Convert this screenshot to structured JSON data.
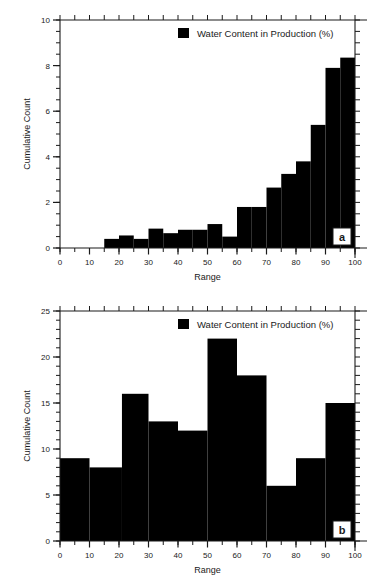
{
  "figure": {
    "background": "#ffffff",
    "series_color": "#000000",
    "axis_color": "#1a1a1a"
  },
  "chart_data": [
    {
      "type": "bar",
      "panel_label": "a",
      "title": "",
      "xlabel": "Range",
      "ylabel": "Cumulative Count",
      "legend": [
        "Water Content in Production (%)"
      ],
      "legend_position": "top-right-inside",
      "grid": false,
      "xlim": [
        0,
        100
      ],
      "ylim": [
        0,
        10
      ],
      "xticks": [
        0,
        10,
        20,
        30,
        40,
        50,
        60,
        70,
        80,
        90,
        100
      ],
      "xtick_labels": [
        "0",
        "10",
        "20",
        "30",
        "40",
        "50",
        "60",
        "70",
        "80",
        "90",
        "100"
      ],
      "x_minor_tick_step": 5,
      "yticks": [
        0,
        2,
        4,
        6,
        8,
        10
      ],
      "ytick_labels": [
        "0",
        "2",
        "4",
        "6",
        "8",
        "10"
      ],
      "y_minor_tick_step": 0.5,
      "bin_width": 5,
      "bin_starts": [
        15,
        20,
        25,
        30,
        35,
        40,
        45,
        50,
        55,
        60,
        65,
        70,
        75,
        80,
        85,
        90,
        95
      ],
      "categories": [
        "15-20",
        "20-25",
        "25-30",
        "30-35",
        "35-40",
        "40-45",
        "45-50",
        "50-55",
        "55-60",
        "60-65",
        "65-70",
        "70-75",
        "75-80",
        "80-85",
        "85-90",
        "90-95",
        "95-100"
      ],
      "values": [
        0.4,
        0.55,
        0.4,
        0.85,
        0.65,
        0.8,
        0.8,
        1.05,
        0.5,
        1.8,
        1.8,
        2.65,
        3.25,
        3.8,
        5.4,
        7.9,
        8.35
      ]
    },
    {
      "type": "bar",
      "panel_label": "b",
      "title": "",
      "xlabel": "Range",
      "ylabel": "Cumulative Count",
      "legend": [
        "Water Content in Production (%)"
      ],
      "legend_position": "top-right-inside",
      "grid": false,
      "xlim": [
        0,
        100
      ],
      "ylim": [
        0,
        25
      ],
      "xticks": [
        0,
        10,
        20,
        30,
        40,
        50,
        60,
        70,
        80,
        90,
        100
      ],
      "xtick_labels": [
        "0",
        "10",
        "20",
        "30",
        "40",
        "50",
        "60",
        "70",
        "80",
        "90",
        "100"
      ],
      "x_minor_tick_step": 5,
      "yticks": [
        0,
        5,
        10,
        15,
        20,
        25
      ],
      "ytick_labels": [
        "0",
        "5",
        "10",
        "15",
        "20",
        "25"
      ],
      "y_minor_tick_step": 1,
      "bin_width": 10,
      "bin_starts": [
        0,
        10,
        21,
        30,
        40,
        50,
        60,
        70,
        80,
        90
      ],
      "categories": [
        "0-10",
        "10-21",
        "21-30",
        "30-40",
        "40-50",
        "50-60",
        "60-70",
        "70-80",
        "80-90",
        "90-100"
      ],
      "values": [
        9,
        8,
        16,
        13,
        12,
        22,
        18,
        6,
        9,
        15
      ]
    }
  ]
}
